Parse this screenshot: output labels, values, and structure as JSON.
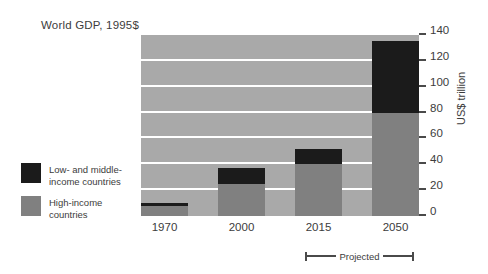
{
  "chart_data": {
    "type": "bar",
    "stacked": true,
    "title": "World GDP, 1995$",
    "xlabel": "",
    "ylabel": "US$ trillion",
    "categories": [
      "1970",
      "2000",
      "2015",
      "2050"
    ],
    "series": [
      {
        "name": "High-income countries",
        "color": "#808080",
        "values": [
          8,
          25,
          40,
          80
        ]
      },
      {
        "name": "Low- and middle-income countries",
        "color": "#1b1b1b",
        "values": [
          2,
          12,
          12,
          55
        ]
      }
    ],
    "totals": [
      10,
      37,
      52,
      135
    ],
    "ylim": [
      0,
      140
    ],
    "yticks": [
      0,
      20,
      40,
      60,
      80,
      100,
      120,
      140
    ],
    "ytick_labels": [
      "0",
      "20",
      "40",
      "60",
      "80",
      "100",
      "120",
      "140"
    ],
    "grid": true,
    "legend_position": "left-outside",
    "annotations": [
      {
        "name": "projected-bracket",
        "label": "Projected",
        "spans": [
          "2015",
          "2050"
        ]
      }
    ],
    "colors": {
      "plot_background": "#a9a9a9",
      "gridline": "#ffffff",
      "high_income": "#808080",
      "low_middle_income": "#1b1b1b",
      "text": "#3c3c3c",
      "axis": "#4a4a4a"
    }
  },
  "legend": {
    "items": [
      {
        "label_line1": "Low- and middle-",
        "label_line2": "income countries",
        "color": "#1b1b1b"
      },
      {
        "label_line1": "High-income",
        "label_line2": "countries",
        "color": "#808080"
      }
    ]
  }
}
